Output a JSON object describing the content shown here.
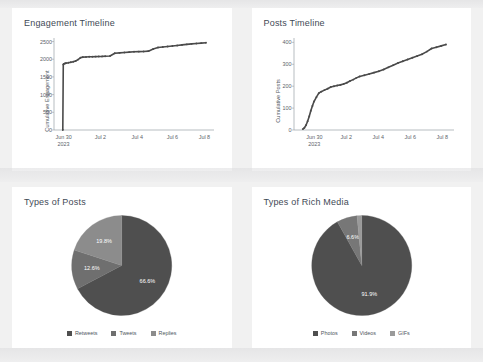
{
  "dashboard": {
    "background_color": "#f1f1f1",
    "panel_color": "#ffffff"
  },
  "panels": [
    {
      "id": "engagement-timeline",
      "title": "Engagement Timeline"
    },
    {
      "id": "posts-timeline",
      "title": "Posts Timeline"
    },
    {
      "id": "types-of-posts",
      "title": "Types of Posts"
    },
    {
      "id": "types-of-rich-media",
      "title": "Types of Rich Media"
    }
  ],
  "chart_data": [
    {
      "type": "line",
      "id": "engagement-timeline",
      "title": "Engagement Timeline",
      "xlabel": "",
      "ylabel": "Cumulative Engagement",
      "ylim": [
        0,
        2600
      ],
      "yticks": [
        0,
        500,
        1000,
        1500,
        2000,
        2500
      ],
      "ytick_labels": [
        "0",
        "500",
        "1000",
        "1500",
        "2000",
        "2500"
      ],
      "xtick_labels": [
        "Jun 30\n2023",
        "Jul 2",
        "Jul 4",
        "Jul 6",
        "Jul 8"
      ],
      "xtick_positions": [
        0.06,
        0.29,
        0.52,
        0.74,
        0.94
      ],
      "grid": false,
      "marker": "dot",
      "line_color": "#4a4a4a",
      "x": [
        0.055,
        0.058,
        0.062,
        0.068,
        0.075,
        0.09,
        0.105,
        0.12,
        0.135,
        0.15,
        0.165,
        0.18,
        0.2,
        0.22,
        0.24,
        0.26,
        0.28,
        0.3,
        0.32,
        0.35,
        0.38,
        0.41,
        0.44,
        0.47,
        0.5,
        0.53,
        0.56,
        0.59,
        0.62,
        0.65,
        0.68,
        0.71,
        0.74,
        0.77,
        0.8,
        0.83,
        0.86,
        0.89,
        0.92,
        0.95
      ],
      "y": [
        0,
        1850,
        1870,
        1880,
        1890,
        1900,
        1915,
        1930,
        1950,
        1990,
        2040,
        2060,
        2065,
        2070,
        2072,
        2075,
        2078,
        2080,
        2085,
        2090,
        2170,
        2180,
        2190,
        2200,
        2210,
        2215,
        2220,
        2228,
        2290,
        2330,
        2345,
        2360,
        2375,
        2390,
        2405,
        2420,
        2435,
        2445,
        2455,
        2465
      ]
    },
    {
      "type": "line",
      "id": "posts-timeline",
      "title": "Posts Timeline",
      "xlabel": "",
      "ylabel": "Cumulative Posts",
      "ylim": [
        0,
        420
      ],
      "yticks": [
        0,
        100,
        200,
        300,
        400
      ],
      "ytick_labels": [
        "0",
        "100",
        "200",
        "300",
        "400"
      ],
      "xtick_labels": [
        "Jun 30\n2023",
        "Jul 2",
        "Jul 4",
        "Jul 6",
        "Jul 8"
      ],
      "xtick_positions": [
        0.13,
        0.33,
        0.53,
        0.73,
        0.93
      ],
      "grid": false,
      "marker": "dot",
      "line_color": "#4a4a4a",
      "x": [
        0.055,
        0.065,
        0.075,
        0.085,
        0.095,
        0.105,
        0.115,
        0.125,
        0.14,
        0.155,
        0.17,
        0.19,
        0.21,
        0.23,
        0.25,
        0.27,
        0.29,
        0.31,
        0.33,
        0.35,
        0.37,
        0.39,
        0.41,
        0.44,
        0.47,
        0.5,
        0.53,
        0.56,
        0.59,
        0.62,
        0.65,
        0.68,
        0.71,
        0.74,
        0.77,
        0.8,
        0.83,
        0.86,
        0.89,
        0.92,
        0.95
      ],
      "y": [
        4,
        10,
        22,
        40,
        62,
        88,
        110,
        130,
        150,
        168,
        175,
        182,
        188,
        196,
        200,
        203,
        206,
        210,
        216,
        224,
        230,
        238,
        244,
        250,
        256,
        262,
        268,
        276,
        286,
        296,
        306,
        314,
        322,
        330,
        338,
        346,
        358,
        372,
        378,
        384,
        390
      ]
    },
    {
      "type": "pie",
      "id": "types-of-posts",
      "title": "Types of Posts",
      "labels": [
        "Retweets",
        "Tweets",
        "Replies"
      ],
      "values": [
        66.6,
        12.6,
        19.8
      ],
      "value_labels": [
        "66.6%",
        "12.6%",
        "19.8%"
      ],
      "colors": [
        "#4f4f4f",
        "#6f6f6f",
        "#8c8c8c"
      ],
      "legend_position": "bottom"
    },
    {
      "type": "pie",
      "id": "types-of-rich-media",
      "title": "Types of Rich Media",
      "labels": [
        "Photos",
        "Videos",
        "GIFs"
      ],
      "values": [
        91.9,
        6.6,
        1.52
      ],
      "value_labels": [
        "91.9%",
        "6.6%",
        "1.52%"
      ],
      "colors": [
        "#4f4f4f",
        "#777777",
        "#9a9a9a"
      ],
      "legend_position": "bottom"
    }
  ]
}
